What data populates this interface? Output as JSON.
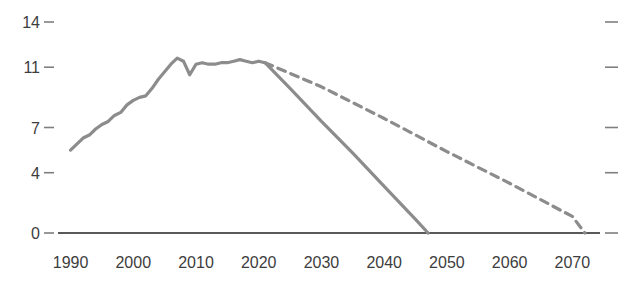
{
  "chart_data": {
    "type": "line",
    "title": "",
    "subtitle": "",
    "xlabel": "",
    "ylabel": "",
    "xlim": [
      1988,
      2076
    ],
    "ylim": [
      0,
      14.6
    ],
    "grid": false,
    "legend_position": "none",
    "y_ticks": [
      0,
      4,
      7,
      11,
      14
    ],
    "y_tick_labels": [
      "0",
      "4",
      "7",
      "11",
      "14"
    ],
    "x_ticks": [
      1990,
      2000,
      2010,
      2020,
      2030,
      2040,
      2050,
      2060,
      2070
    ],
    "x_tick_labels": [
      "1990",
      "2000",
      "2010",
      "2020",
      "2030",
      "2040",
      "2050",
      "2060",
      "2070"
    ],
    "colors": {
      "line": "#8c8c8c",
      "axis": "#595959",
      "tick": "#7f7f7f",
      "text": "#3d3d3d"
    },
    "series": [
      {
        "name": "historical-and-fast-decline",
        "style": "solid",
        "color": "#8c8c8c",
        "x": [
          1990,
          1991,
          1992,
          1993,
          1994,
          1995,
          1996,
          1997,
          1998,
          1999,
          2000,
          2001,
          2002,
          2003,
          2004,
          2005,
          2006,
          2007,
          2008,
          2009,
          2010,
          2011,
          2012,
          2013,
          2014,
          2015,
          2016,
          2017,
          2018,
          2019,
          2020,
          2021,
          2025,
          2030,
          2035,
          2040,
          2045,
          2047
        ],
        "values": [
          5.5,
          5.9,
          6.3,
          6.5,
          6.9,
          7.2,
          7.4,
          7.8,
          8.0,
          8.5,
          8.8,
          9.0,
          9.1,
          9.6,
          10.2,
          10.7,
          11.2,
          11.6,
          11.4,
          10.5,
          11.2,
          11.3,
          11.2,
          11.2,
          11.3,
          11.3,
          11.4,
          11.5,
          11.4,
          11.3,
          11.4,
          11.3,
          9.6,
          7.4,
          5.3,
          3.1,
          0.9,
          0.0
        ]
      },
      {
        "name": "slow-decline-projection",
        "style": "dashed",
        "color": "#8c8c8c",
        "x": [
          2021,
          2030,
          2040,
          2050,
          2060,
          2070,
          2072
        ],
        "values": [
          11.3,
          9.7,
          7.6,
          5.4,
          3.3,
          1.1,
          0.0
        ]
      }
    ]
  }
}
